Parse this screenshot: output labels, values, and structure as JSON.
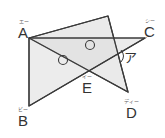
{
  "diagram": {
    "type": "geometry",
    "fill_color": "#e6e6e6",
    "stroke_color": "#3a3a3a",
    "points": {
      "A": {
        "label": "A",
        "ruby": "エー",
        "x": 29,
        "y": 38
      },
      "B": {
        "label": "B",
        "ruby": "ビー",
        "x": 29,
        "y": 106
      },
      "C": {
        "label": "C",
        "ruby": "シー",
        "x": 145,
        "y": 38
      },
      "D": {
        "label": "D",
        "ruby": "ディー",
        "x": 128,
        "y": 92
      },
      "E": {
        "label": "E",
        "ruby": "イー",
        "x": 87,
        "y": 72
      },
      "P": {
        "label": "",
        "x": 108,
        "y": 16
      }
    },
    "triangles": [
      {
        "name": "triangle-APD",
        "vertices": [
          "A",
          "P",
          "D"
        ]
      },
      {
        "name": "triangle-ABC",
        "vertices": [
          "A",
          "B",
          "C"
        ]
      }
    ],
    "angle_markers": [
      {
        "name": "equal-angle-marker-1",
        "symbol": "○",
        "x": 90,
        "y": 45
      },
      {
        "name": "equal-angle-marker-2",
        "symbol": "○",
        "x": 62,
        "y": 60
      }
    ],
    "target_angle": {
      "label": "ア",
      "x": 125,
      "y": 50
    }
  }
}
